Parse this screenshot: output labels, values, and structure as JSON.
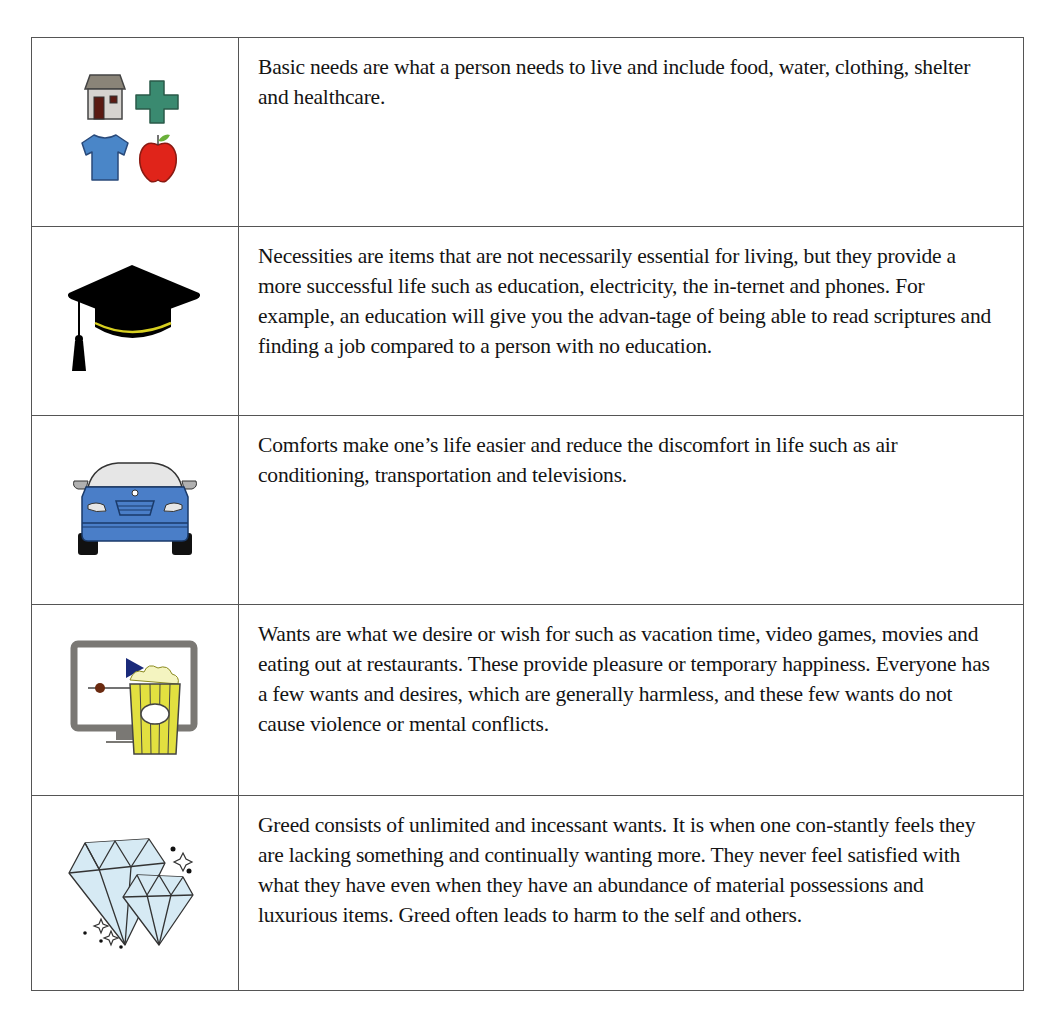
{
  "table": {
    "rows": [
      {
        "icon": "basic-needs-icons",
        "icon_parts": [
          "house-icon",
          "medical-cross-icon",
          "shirt-icon",
          "apple-icon"
        ],
        "text": "Basic needs are what a person needs to live and include food, water, clothing, shelter and healthcare."
      },
      {
        "icon": "graduation-cap-icon",
        "text": "Necessities are items that are not necessarily essential for living, but they provide a more successful life such as education, electricity, the in-ternet and phones. For example, an education will give you the advan-tage of being able to read scriptures and finding a job compared to a person with no education."
      },
      {
        "icon": "car-icon",
        "text": "Comforts make one’s life easier and reduce the discomfort in life such as air conditioning, transportation and televisions."
      },
      {
        "icon": "tv-popcorn-icon",
        "text": "Wants are what we desire or wish for such as vacation time, video games, movies and eating out at restaurants. These provide pleasure or temporary happiness. Everyone has a few wants and desires, which are generally harmless, and these few wants do not cause violence or mental conflicts."
      },
      {
        "icon": "diamonds-icon",
        "text": "Greed consists of unlimited and incessant wants. It is when one con-stantly feels they are lacking something and continually wanting more. They never feel satisfied with what they have even when they have an abundance of material possessions and luxurious items. Greed often leads to harm to the self and others."
      }
    ]
  },
  "colors": {
    "border": "#555555",
    "house_roof": "#8a8478",
    "house_wall": "#d6d3cf",
    "house_door": "#5a1a12",
    "cross": "#3a8a70",
    "shirt": "#4a86c8",
    "apple": "#e0241a",
    "leaf": "#6ab03a",
    "cap": "#000000",
    "cap_band": "#d8d020",
    "car_body": "#4a7ec8",
    "car_glass": "#e6e6e6",
    "tv_frame": "#7a7874",
    "play": "#1a2a7a",
    "dot": "#6a2a10",
    "popcorn_box": "#e2e040",
    "diamond": "#d6eaf4"
  }
}
